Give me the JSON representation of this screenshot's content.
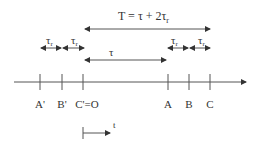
{
  "diagram": {
    "title_formula": "T = τ + 2τ",
    "title_subscript": "r",
    "tau_label": "τ",
    "tau_r_label": "τ",
    "tau_r_subscript": "r",
    "axis_points": [
      {
        "label": "A'",
        "x": 40
      },
      {
        "label": "B'",
        "x": 62
      },
      {
        "label": "C'=O",
        "x": 83
      },
      {
        "label": "A",
        "x": 168
      },
      {
        "label": "B",
        "x": 189
      },
      {
        "label": "C",
        "x": 210
      }
    ],
    "time_label": "t",
    "colors": {
      "line": "#555555",
      "text": "#333333",
      "background": "#ffffff"
    }
  }
}
